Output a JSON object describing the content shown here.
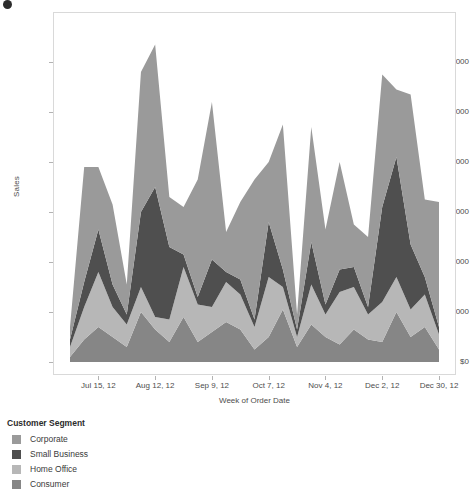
{
  "corner": {
    "icon": "circle-glyph"
  },
  "axes": {
    "y_title": "Sales",
    "x_title": "Week of Order Date",
    "y_ticks": [
      "$0",
      "$20,000",
      "$40,000",
      "$60,000",
      "$80,000",
      "$100,000",
      "$120,000"
    ],
    "x_ticks": [
      "Jul 15, 12",
      "Aug 12, 12",
      "Sep 9, 12",
      "Oct 7, 12",
      "Nov 4, 12",
      "Dec 2, 12",
      "Dec 30, 12"
    ]
  },
  "legend": {
    "title": "Customer Segment",
    "items": [
      {
        "label": "Corporate",
        "color": "#9a9a9a"
      },
      {
        "label": "Small Business",
        "color": "#4f4f4f"
      },
      {
        "label": "Home Office",
        "color": "#b7b7b7"
      },
      {
        "label": "Consumer",
        "color": "#868686"
      }
    ]
  },
  "chart_data": {
    "type": "area",
    "stacked": true,
    "title": "",
    "xlabel": "Week of Order Date",
    "ylabel": "Sales",
    "ylim": [
      0,
      140000
    ],
    "yticks": [
      0,
      20000,
      40000,
      60000,
      80000,
      100000,
      120000
    ],
    "grid": false,
    "legend_position": "bottom-left",
    "legend_title": "Customer Segment",
    "x": [
      "Jul 1, 12",
      "Jul 8, 12",
      "Jul 15, 12",
      "Jul 22, 12",
      "Jul 29, 12",
      "Aug 5, 12",
      "Aug 12, 12",
      "Aug 19, 12",
      "Aug 26, 12",
      "Sep 2, 12",
      "Sep 9, 12",
      "Sep 16, 12",
      "Sep 23, 12",
      "Sep 30, 12",
      "Oct 7, 12",
      "Oct 14, 12",
      "Oct 21, 12",
      "Oct 28, 12",
      "Nov 4, 12",
      "Nov 11, 12",
      "Nov 18, 12",
      "Nov 25, 12",
      "Dec 2, 12",
      "Dec 9, 12",
      "Dec 16, 12",
      "Dec 23, 12",
      "Dec 30, 12"
    ],
    "series": [
      {
        "name": "Consumer",
        "color": "#868686",
        "values": [
          2000,
          9000,
          14000,
          10000,
          6000,
          20000,
          13000,
          8000,
          18000,
          8000,
          12000,
          16000,
          13000,
          5000,
          10000,
          21000,
          6000,
          15000,
          10000,
          7000,
          13000,
          9000,
          8000,
          20000,
          10000,
          14000,
          5000
        ]
      },
      {
        "name": "Home Office",
        "color": "#b7b7b7",
        "values": [
          4000,
          13000,
          22000,
          12000,
          9000,
          10000,
          5000,
          9000,
          20000,
          15000,
          10000,
          16000,
          14000,
          9000,
          24000,
          9000,
          4000,
          16000,
          9000,
          21000,
          17000,
          10000,
          16000,
          14000,
          11000,
          13000,
          6000
        ]
      },
      {
        "name": "Small Business",
        "color": "#4f4f4f",
        "values": [
          3000,
          10000,
          17000,
          9000,
          4000,
          30000,
          52000,
          29000,
          5000,
          3000,
          19000,
          4000,
          6000,
          3000,
          22000,
          7000,
          3000,
          17000,
          4000,
          9000,
          8000,
          3000,
          38000,
          48000,
          26000,
          7000,
          3000
        ]
      },
      {
        "name": "Corporate",
        "color": "#9a9a9a",
        "values": [
          5000,
          46000,
          25000,
          32000,
          12000,
          56000,
          57000,
          20000,
          19000,
          47000,
          63000,
          16000,
          31000,
          56000,
          24000,
          58000,
          6000,
          46000,
          30000,
          43000,
          17000,
          28000,
          53000,
          27000,
          60000,
          31000,
          50000
        ]
      }
    ],
    "stacked_totals": [
      14000,
      78000,
      78000,
      63000,
      31000,
      116000,
      127000,
      66000,
      62000,
      73000,
      104000,
      52000,
      64000,
      73000,
      80000,
      95000,
      19000,
      94000,
      53000,
      80000,
      55000,
      50000,
      115000,
      109000,
      107000,
      65000,
      64000
    ]
  }
}
